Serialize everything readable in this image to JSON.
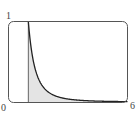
{
  "chart_data": {
    "type": "area",
    "title": "",
    "xlabel": "",
    "ylabel": "",
    "function": "y = 1/x^3",
    "xlim": [
      0,
      6
    ],
    "ylim": [
      0,
      1
    ],
    "grid": false,
    "legend": null,
    "shaded_region": {
      "from_x": 1,
      "to_x": 6,
      "fill": "#e4e4e4"
    },
    "vertical_line_x": 1,
    "x": [
      1,
      1.25,
      1.5,
      1.75,
      2,
      2.5,
      3,
      4,
      5,
      6
    ],
    "values": [
      1.0,
      0.512,
      0.296,
      0.187,
      0.125,
      0.064,
      0.037,
      0.016,
      0.008,
      0.005
    ],
    "tick_labels": {
      "y_top": "1",
      "origin": "0",
      "x_right": "6"
    },
    "colors": {
      "frame": "#555555",
      "curve": "#222222",
      "fill": "#e4e4e4"
    }
  }
}
